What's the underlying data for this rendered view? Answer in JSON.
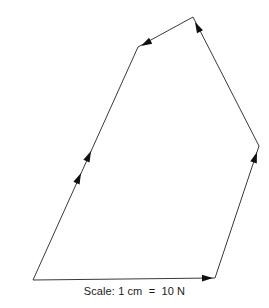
{
  "figure": {
    "caption": "Scale: 1 cm  =  10 N",
    "background_color": "#ffffff",
    "line_color": "#3a3a3a",
    "arrow_color": "#111111"
  },
  "chart_data": {
    "type": "diagram",
    "subtype": "vector-polygon",
    "title": "",
    "caption": "Scale: 1 cm  =  10 N",
    "scale": {
      "length_unit": "cm",
      "length_value": 1,
      "force_value": 10,
      "force_unit": "N",
      "text": "Scale: 1 cm  =  10 N"
    },
    "closed": true,
    "vertices": [
      {
        "name": "bottom-left",
        "x": 33,
        "y": 280
      },
      {
        "name": "top-left",
        "x": 138,
        "y": 47
      },
      {
        "name": "apex",
        "x": 193,
        "y": 17
      },
      {
        "name": "right",
        "x": 259,
        "y": 146
      },
      {
        "name": "bottom-right",
        "x": 215,
        "y": 278
      }
    ],
    "segments": [
      {
        "name": "bottom-edge",
        "from": {
          "x": 33,
          "y": 280
        },
        "to": {
          "x": 215,
          "y": 278
        },
        "arrow_count": 1,
        "arrow_direction": "right",
        "arrow_positions": [
          {
            "x": 213,
            "y": 278,
            "angle": 359
          }
        ]
      },
      {
        "name": "right-lower-edge",
        "from": {
          "x": 215,
          "y": 278
        },
        "to": {
          "x": 259,
          "y": 146
        },
        "arrow_count": 1,
        "arrow_direction": "up-right",
        "arrow_positions": [
          {
            "x": 257,
            "y": 152,
            "angle": -71.6
          }
        ]
      },
      {
        "name": "right-upper-edge",
        "from": {
          "x": 259,
          "y": 146
        },
        "to": {
          "x": 193,
          "y": 17
        },
        "arrow_count": 1,
        "arrow_direction": "up-left",
        "arrow_positions": [
          {
            "x": 195,
            "y": 22,
            "angle": -117.1
          }
        ]
      },
      {
        "name": "top-edge",
        "from": {
          "x": 193,
          "y": 17
        },
        "to": {
          "x": 138,
          "y": 47
        },
        "arrow_count": 1,
        "arrow_direction": "down-left",
        "arrow_positions": [
          {
            "x": 141,
            "y": 46,
            "angle": 151.4
          }
        ]
      },
      {
        "name": "left-long-edge",
        "from": {
          "x": 138,
          "y": 47
        },
        "to": {
          "x": 33,
          "y": 280
        },
        "arrow_count": 2,
        "arrow_direction": "up-right",
        "arrow_positions": [
          {
            "x": 91,
            "y": 151,
            "angle": -65.7
          },
          {
            "x": 81,
            "y": 173,
            "angle": -65.7
          }
        ]
      }
    ]
  }
}
